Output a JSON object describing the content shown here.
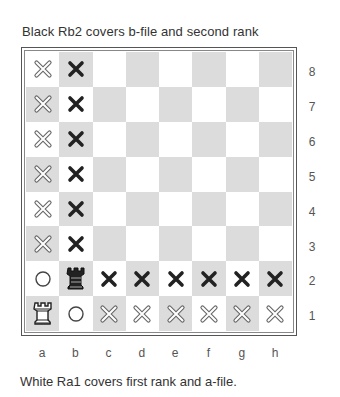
{
  "captions": {
    "top": "Black Rb2 covers b-file and second rank",
    "bottom": "White Ra1 covers first rank and a-file."
  },
  "board": {
    "files": [
      "a",
      "b",
      "c",
      "d",
      "e",
      "f",
      "g",
      "h"
    ],
    "ranks": [
      "8",
      "7",
      "6",
      "5",
      "4",
      "3",
      "2",
      "1"
    ],
    "colors": {
      "light": "#ffffff",
      "dark": "#dcdcdc"
    },
    "squares": [
      [
        "x-outline",
        "x-solid",
        "",
        "",
        "",
        "",
        "",
        ""
      ],
      [
        "x-outline",
        "x-solid",
        "",
        "",
        "",
        "",
        "",
        ""
      ],
      [
        "x-outline",
        "x-solid",
        "",
        "",
        "",
        "",
        "",
        ""
      ],
      [
        "x-outline",
        "x-solid",
        "",
        "",
        "",
        "",
        "",
        ""
      ],
      [
        "x-outline",
        "x-solid",
        "",
        "",
        "",
        "",
        "",
        ""
      ],
      [
        "x-outline",
        "x-solid",
        "",
        "",
        "",
        "",
        "",
        ""
      ],
      [
        "circle",
        "rook-black",
        "x-solid",
        "x-solid",
        "x-solid",
        "x-solid",
        "x-solid",
        "x-solid"
      ],
      [
        "rook-white",
        "circle",
        "x-outline",
        "x-outline",
        "x-outline",
        "x-outline",
        "x-outline",
        "x-outline"
      ]
    ],
    "legend": {
      "x-solid": "square attacked by black rook",
      "x-outline": "square attacked by white rook",
      "circle": "square controlled / blocked"
    }
  }
}
